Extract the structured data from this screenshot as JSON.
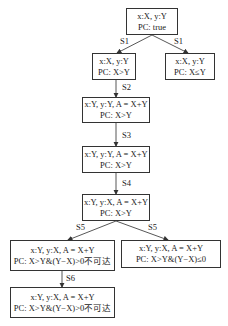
{
  "diagram": {
    "nodes": [
      {
        "id": "n0",
        "state": "x:X, y:Y",
        "pc": "PC: true"
      },
      {
        "id": "n1",
        "state": "x:X, y:Y",
        "pc": "PC: X>Y"
      },
      {
        "id": "n2",
        "state": "x:X, y:Y",
        "pc": "PC: X≤Y"
      },
      {
        "id": "n3",
        "state": "x:Y, y:Y, A = X+Y",
        "pc": "PC: X>Y"
      },
      {
        "id": "n4",
        "state": "x:Y, y:Y, A = X+Y",
        "pc": "PC: X>Y"
      },
      {
        "id": "n5",
        "state": "x:Y, y:X, A = X+Y",
        "pc": "PC: X>Y"
      },
      {
        "id": "n6",
        "state": "x:Y, y:X, A = X+Y",
        "pc": "PC: X>Y&(Y−X)>0不可达"
      },
      {
        "id": "n7",
        "state": "x:Y, y:X, A = X+Y",
        "pc": "PC: X>Y&(Y−X)≤0"
      },
      {
        "id": "n8",
        "state": "x:Y, y:X, A = X+Y",
        "pc": "PC: X>Y&(Y−X)>0不可达"
      }
    ],
    "edges": [
      {
        "from": "n0",
        "to": "n1",
        "label": "S1"
      },
      {
        "from": "n0",
        "to": "n2",
        "label": "S1"
      },
      {
        "from": "n1",
        "to": "n3",
        "label": "S2"
      },
      {
        "from": "n3",
        "to": "n4",
        "label": "S3"
      },
      {
        "from": "n4",
        "to": "n5",
        "label": "S4"
      },
      {
        "from": "n5",
        "to": "n6",
        "label": "S5"
      },
      {
        "from": "n5",
        "to": "n7",
        "label": "S5"
      },
      {
        "from": "n6",
        "to": "n8",
        "label": "S6"
      }
    ]
  }
}
